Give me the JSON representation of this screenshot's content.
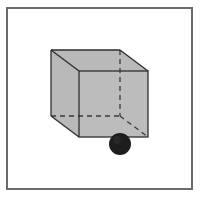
{
  "figure": {
    "colors": {
      "frame": "#6b6b6b",
      "cube_fill": "#b8b8b8",
      "edge": "#333333",
      "ball": "#1e1e1e",
      "background": "#ffffff"
    },
    "cube": {
      "back_face": {
        "tl": [
          51,
          50
        ],
        "tr": [
          120,
          50
        ],
        "bl": [
          51,
          116
        ],
        "br": [
          120,
          116
        ]
      },
      "front_face": {
        "tl": [
          79,
          71
        ],
        "tr": [
          148,
          71
        ],
        "bl": [
          79,
          137
        ],
        "br": [
          148,
          137
        ]
      }
    },
    "ball": {
      "cx": 120,
      "cy": 144,
      "r": 11
    }
  }
}
